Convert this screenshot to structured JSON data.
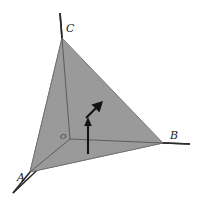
{
  "figure": {
    "title_alt": "Triangle ABC on 3D coordinate axes with two vectors at origin",
    "background_color": "#ffffff",
    "canvas": {
      "width": 198,
      "height": 203
    }
  },
  "labels": {
    "vertex_a": "A",
    "vertex_b": "B",
    "vertex_c": "C",
    "origin": "O"
  },
  "points": {
    "origin": {
      "x": 70,
      "y": 139
    },
    "a": {
      "x": 30,
      "y": 172
    },
    "b": {
      "x": 163,
      "y": 143
    },
    "c": {
      "x": 62,
      "y": 38
    }
  },
  "label_positions": {
    "a": {
      "x": 17,
      "y": 181
    },
    "b": {
      "x": 170,
      "y": 139
    },
    "c": {
      "x": 66,
      "y": 32
    },
    "origin": {
      "x": 60,
      "y": 139
    }
  },
  "axes": {
    "z_axis": {
      "from": {
        "x": 70,
        "y": 139
      },
      "to": {
        "x": 60,
        "y": 13
      }
    },
    "x_axis": {
      "from": {
        "x": 70,
        "y": 139
      },
      "to": {
        "x": 190,
        "y": 144
      }
    },
    "y_axis": {
      "from": {
        "x": 70,
        "y": 139
      },
      "to": {
        "x": 13,
        "y": 193
      }
    }
  },
  "faces": {
    "triangle_abc": {
      "points": "30,172 163,143 62,38",
      "fill": "#9a9a9a",
      "stroke": "#6f6f6f"
    },
    "face_oac": {
      "points": "70,139 30,172 62,38",
      "fill": "#8e8e8e",
      "stroke": "#6f6f6f"
    },
    "face_oab": {
      "points": "70,139 30,172 163,143",
      "fill": "#8a8a8a",
      "stroke": "#6f6f6f"
    }
  },
  "vectors": {
    "vertical": {
      "name": "vertical-arrow",
      "from": {
        "x": 88,
        "y": 154
      },
      "to": {
        "x": 88,
        "y": 122
      },
      "head": "88,117 84.2,126 91.8,126",
      "color": "#141414"
    },
    "diagonal": {
      "name": "diagonal-arrow",
      "from": {
        "x": 86,
        "y": 118
      },
      "to": {
        "x": 99,
        "y": 105
      },
      "head": "103,101 91.5,104.5 99.5,112.5",
      "color": "#141414"
    }
  },
  "colors": {
    "axis": "#2b2b2b",
    "edge": "#555555",
    "arrow": "#141414",
    "fill_main": "#9a9a9a",
    "fill_left": "#8e8e8e",
    "fill_base": "#8a8a8a",
    "label_text": "#1a1a1a"
  }
}
